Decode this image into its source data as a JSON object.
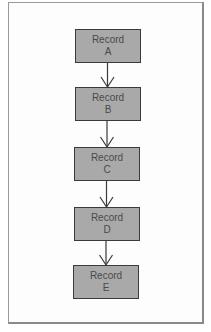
{
  "diagram": {
    "type": "linked-list-chain",
    "colors": {
      "box_fill": "#a9a9a9",
      "box_border": "#3a3a3a",
      "text": "#4a4a4a",
      "arrow": "#3a3a3a",
      "frame": "#9a9a9a"
    },
    "nodes": [
      {
        "id": "A",
        "line1": "Record",
        "line2": "A"
      },
      {
        "id": "B",
        "line1": "Record",
        "line2": "B"
      },
      {
        "id": "C",
        "line1": "Record",
        "line2": "C"
      },
      {
        "id": "D",
        "line1": "Record",
        "line2": "D"
      },
      {
        "id": "E",
        "line1": "Record",
        "line2": "E"
      }
    ],
    "edges": [
      {
        "from": "A",
        "to": "B"
      },
      {
        "from": "B",
        "to": "C"
      },
      {
        "from": "C",
        "to": "D"
      },
      {
        "from": "D",
        "to": "E"
      }
    ]
  }
}
